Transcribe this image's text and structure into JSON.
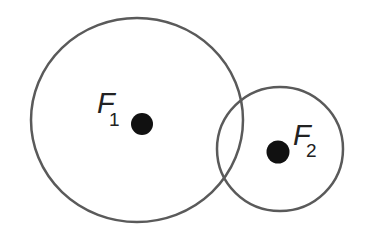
{
  "diagram": {
    "stroke_color": "#5a5a5a",
    "dot_color": "#111111",
    "circles": [
      {
        "name": "large-circle",
        "cx": 137,
        "cy": 120,
        "rx": 106,
        "ry": 102
      },
      {
        "name": "small-circle",
        "cx": 280,
        "cy": 149,
        "rx": 63,
        "ry": 62
      }
    ],
    "foci": [
      {
        "name": "focus-1",
        "cx": 142,
        "cy": 124,
        "r": 11,
        "label": "F",
        "subscript": "1"
      },
      {
        "name": "focus-2",
        "cx": 278,
        "cy": 152,
        "r": 11.5,
        "label": "F",
        "subscript": "2"
      }
    ]
  }
}
